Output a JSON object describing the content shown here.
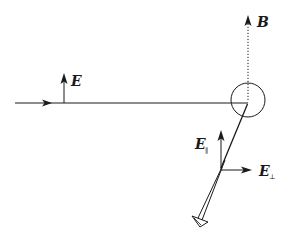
{
  "diagram": {
    "colors": {
      "background": "#ffffff",
      "stroke": "#1a1a1a"
    },
    "labels": {
      "incident_field": "E",
      "magnetic_field": "B",
      "parallel_field": "E",
      "parallel_subscript": "∥",
      "perpendicular_field": "E",
      "perpendicular_subscript": "⊥"
    },
    "elements": [
      {
        "id": "incident-beam",
        "type": "arrow-line",
        "from": [
          15,
          103
        ],
        "to": [
          248,
          103
        ]
      },
      {
        "id": "incident-E-vector",
        "type": "arrow",
        "from": [
          64,
          103
        ],
        "to": [
          64,
          74
        ]
      },
      {
        "id": "scatterer-circle",
        "type": "circle",
        "center": [
          248,
          100
        ],
        "radius": 17
      },
      {
        "id": "B-vector",
        "type": "dotted-arrow",
        "from": [
          248,
          100
        ],
        "to": [
          248,
          17
        ]
      },
      {
        "id": "scattered-beam",
        "type": "double-line-arrow",
        "from": [
          248,
          104
        ],
        "to": [
          200,
          220
        ]
      },
      {
        "id": "E-parallel-vector",
        "type": "arrow",
        "from": [
          221,
          170
        ],
        "to": [
          221,
          130
        ]
      },
      {
        "id": "E-perpendicular-vector",
        "type": "arrow",
        "from": [
          221,
          170
        ],
        "to": [
          251,
          170
        ]
      }
    ]
  }
}
